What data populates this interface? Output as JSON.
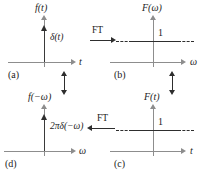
{
  "figure": {
    "width": 212,
    "height": 178,
    "colors": {
      "axis": "#8d8d8d",
      "signal": "#2e2e2e",
      "text": "#1c1c1c",
      "background": "#ffffff"
    }
  },
  "panels": [
    {
      "tag": "(a)",
      "vertical_axis_label": "f(t)",
      "horizontal_axis_label": "t",
      "signal_label": "δ(t)",
      "signal_type": "impulse",
      "position": "top-left"
    },
    {
      "tag": "(b)",
      "vertical_axis_label": "F(ω)",
      "horizontal_axis_label": "ω",
      "signal_label": "1",
      "signal_type": "constant",
      "position": "top-right"
    },
    {
      "tag": "(c)",
      "vertical_axis_label": "F(t)",
      "horizontal_axis_label": "t",
      "signal_label": "1",
      "signal_type": "constant",
      "position": "bottom-right"
    },
    {
      "tag": "(d)",
      "vertical_axis_label": "f(−ω)",
      "horizontal_axis_label": "ω",
      "signal_label": "2πδ(−ω)",
      "signal_type": "impulse",
      "position": "bottom-left"
    }
  ],
  "connectors": [
    {
      "name": "ft-top",
      "label": "FT",
      "direction": "right",
      "from": "(a)",
      "to": "(b)"
    },
    {
      "name": "ft-bottom",
      "label": "FT",
      "direction": "left",
      "from": "(c)",
      "to": "(d)"
    },
    {
      "name": "duality-left",
      "label": "",
      "direction": "up-down",
      "from": "(a)",
      "to": "(d)"
    },
    {
      "name": "duality-right",
      "label": "",
      "direction": "up-down",
      "from": "(b)",
      "to": "(c)"
    }
  ]
}
